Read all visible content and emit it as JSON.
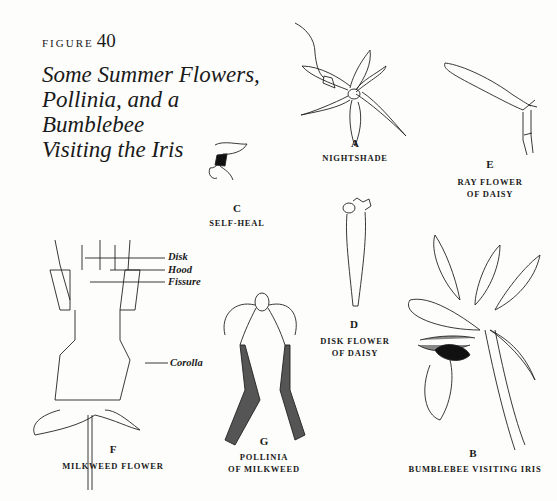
{
  "figure": {
    "label": "FIGURE",
    "number": "40",
    "title_lines": [
      "Some Summer Flowers,",
      "Pollinia, and a Bumblebee",
      "Visiting the Iris"
    ]
  },
  "panels": [
    {
      "letter": "A",
      "caption": [
        "NIGHTSHADE"
      ]
    },
    {
      "letter": "B",
      "caption": [
        "BUMBLEBEE VISITING IRIS"
      ]
    },
    {
      "letter": "C",
      "caption": [
        "SELF-HEAL"
      ]
    },
    {
      "letter": "D",
      "caption": [
        "DISK FLOWER",
        "OF DAISY"
      ]
    },
    {
      "letter": "E",
      "caption": [
        "RAY FLOWER",
        "OF DAISY"
      ]
    },
    {
      "letter": "F",
      "caption": [
        "MILKWEED FLOWER"
      ]
    },
    {
      "letter": "G",
      "caption": [
        "POLLINIA",
        "OF MILKWEED"
      ]
    }
  ],
  "milkweed_callouts": [
    "Disk",
    "Hood",
    "Fissure",
    "Corolla"
  ]
}
